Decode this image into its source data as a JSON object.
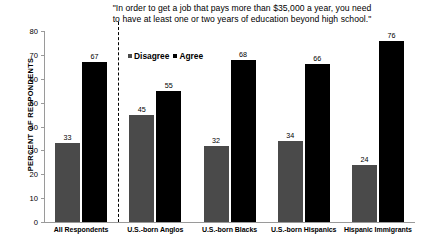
{
  "chart_data": {
    "type": "bar",
    "title": "\"In order to get a job that pays more than $35,000 a year, you need to have at least one or two years of education beyond high school.\"",
    "title_line1": "\"In order to get a job that pays more than $35,000 a year, you need",
    "title_line2": "to have at least one or two years of education beyond high school.\"",
    "xlabel": "",
    "ylabel": "PERCENT OF RESPONDENTS",
    "ylim": [
      0,
      80
    ],
    "yticks": [
      0,
      10,
      20,
      30,
      40,
      50,
      60,
      70,
      80
    ],
    "grid": false,
    "legend_position": "inside-top-left",
    "categories": [
      "All Respondents",
      "U.S.-born Anglos",
      "U.S.-born Blacks",
      "U.S.-born Hispanics",
      "Hispanic Immigrants"
    ],
    "series": [
      {
        "name": "Disagree",
        "color": "#4a4a4a",
        "values": [
          33,
          45,
          32,
          34,
          24
        ]
      },
      {
        "name": "Agree",
        "color": "#000000",
        "values": [
          67,
          55,
          68,
          66,
          76
        ]
      }
    ],
    "annotations": [
      {
        "type": "vertical-dashed-separator",
        "after_category": "All Respondents"
      }
    ]
  },
  "legend": {
    "items": [
      {
        "label": "Disagree",
        "color": "#4a4a4a"
      },
      {
        "label": "Agree",
        "color": "#000000"
      }
    ]
  }
}
